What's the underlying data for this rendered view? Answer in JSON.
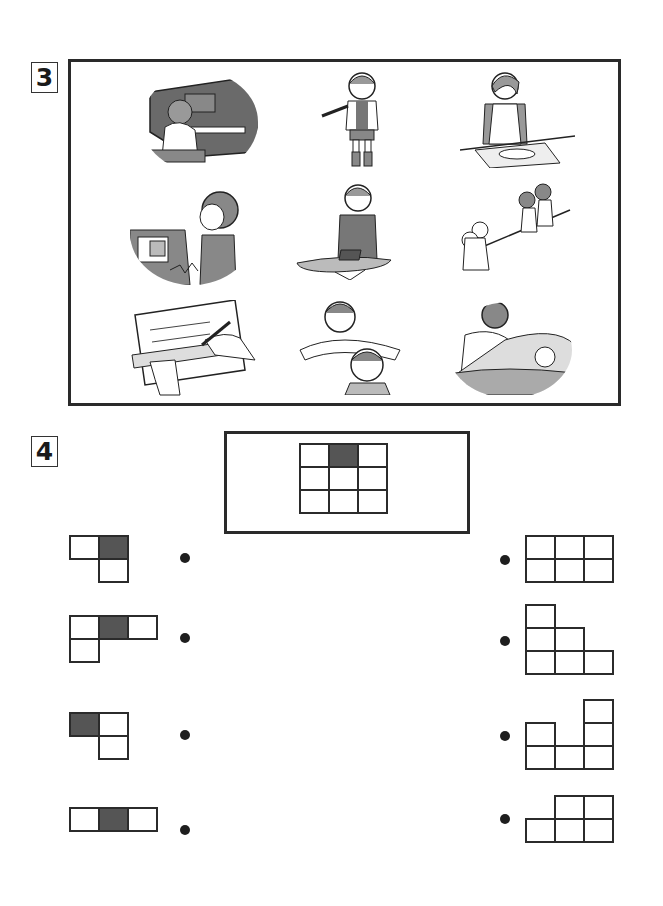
{
  "exercise3": {
    "number": "3",
    "illustrations": [
      {
        "row": 0,
        "col": 0,
        "label": "child-playing-piano"
      },
      {
        "row": 0,
        "col": 1,
        "label": "girl-waving-talking"
      },
      {
        "row": 0,
        "col": 2,
        "label": "woman-cutting-fish"
      },
      {
        "row": 1,
        "col": 0,
        "label": "child-on-telephone"
      },
      {
        "row": 1,
        "col": 1,
        "label": "girl-ironing"
      },
      {
        "row": 1,
        "col": 2,
        "label": "children-tug-of-war"
      },
      {
        "row": 2,
        "col": 0,
        "label": "hand-writing-with-ruler"
      },
      {
        "row": 2,
        "col": 1,
        "label": "father-cutting-hair"
      },
      {
        "row": 2,
        "col": 2,
        "label": "mother-tucking-child-in-bed"
      }
    ]
  },
  "exercise4": {
    "number": "4",
    "reference_grid": {
      "rows": 3,
      "cols": 3,
      "shaded": [
        [
          0,
          1
        ]
      ]
    },
    "left_pieces": [
      {
        "cells": [
          [
            0,
            0
          ],
          [
            0,
            1
          ],
          [
            1,
            1
          ]
        ],
        "shaded": [
          [
            0,
            1
          ]
        ]
      },
      {
        "cells": [
          [
            0,
            0
          ],
          [
            0,
            1
          ],
          [
            0,
            2
          ],
          [
            1,
            0
          ]
        ],
        "shaded": [
          [
            0,
            1
          ]
        ]
      },
      {
        "cells": [
          [
            0,
            0
          ],
          [
            0,
            1
          ],
          [
            1,
            1
          ]
        ],
        "shaded": [
          [
            0,
            0
          ]
        ]
      },
      {
        "cells": [
          [
            0,
            0
          ],
          [
            0,
            1
          ],
          [
            0,
            2
          ]
        ],
        "shaded": [
          [
            0,
            1
          ]
        ]
      }
    ],
    "right_shapes": [
      {
        "cells": [
          [
            0,
            0
          ],
          [
            0,
            1
          ],
          [
            0,
            2
          ],
          [
            1,
            0
          ],
          [
            1,
            1
          ],
          [
            1,
            2
          ]
        ]
      },
      {
        "cells": [
          [
            0,
            0
          ],
          [
            1,
            0
          ],
          [
            1,
            1
          ],
          [
            2,
            0
          ],
          [
            2,
            1
          ],
          [
            2,
            2
          ]
        ]
      },
      {
        "cells": [
          [
            0,
            2
          ],
          [
            1,
            0
          ],
          [
            1,
            2
          ],
          [
            2,
            0
          ],
          [
            2,
            1
          ],
          [
            2,
            2
          ]
        ]
      },
      {
        "cells": [
          [
            0,
            1
          ],
          [
            0,
            2
          ],
          [
            1,
            0
          ],
          [
            1,
            1
          ],
          [
            1,
            2
          ]
        ]
      }
    ],
    "colors": {
      "shaded": "#555555",
      "border": "#2b2b2b"
    }
  }
}
